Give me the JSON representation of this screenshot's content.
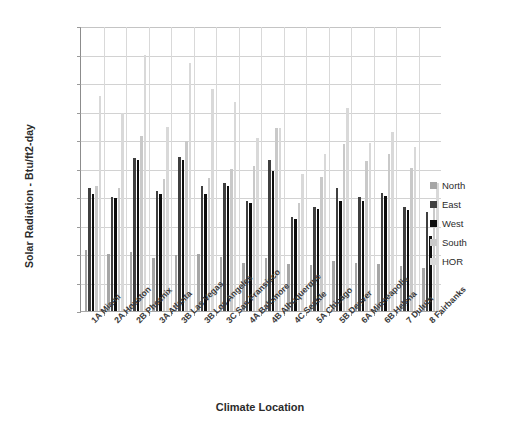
{
  "chart_data": {
    "type": "bar",
    "title": "",
    "xlabel": "Climate Location",
    "ylabel": "Solar Radiation - Btu/ft2-day",
    "ylim": [
      0,
      2000
    ],
    "ytick_step": 200,
    "ytick_labels": [
      "0",
      "200",
      "400",
      "600",
      "800",
      "1,000",
      "1,200",
      "1,400",
      "1,600",
      "1,800",
      "2,000"
    ],
    "grid": true,
    "legend_position": "right",
    "categories": [
      "1A Miami",
      "2A Houston",
      "2B Phoenix",
      "3A Atlanta",
      "3B Las Vegas",
      "3B Los Angeles",
      "3C San Fransisco",
      "4A Baltimore",
      "4B Albuquerque",
      "4C Seattle",
      "5A Chicago",
      "5B Denver",
      "6A Minneapolis",
      "6B Helena",
      "7 Duluth",
      "8 Fairbanks"
    ],
    "series": [
      {
        "name": "North",
        "color": "#a6a6a6",
        "values": [
          425,
          400,
          415,
          370,
          395,
          400,
          380,
          340,
          370,
          330,
          320,
          350,
          340,
          330,
          315,
          300
        ]
      },
      {
        "name": "East",
        "color": "#3f3f3f",
        "values": [
          860,
          800,
          1075,
          840,
          1080,
          880,
          900,
          770,
          1060,
          660,
          730,
          860,
          800,
          825,
          730,
          695
        ]
      },
      {
        "name": "West",
        "color": "#0d0d0d",
        "values": [
          820,
          790,
          1060,
          820,
          1060,
          820,
          880,
          755,
          985,
          645,
          715,
          770,
          775,
          805,
          710,
          525
        ]
      },
      {
        "name": "South",
        "color": "#c9c9c9",
        "values": [
          880,
          860,
          1225,
          925,
          1190,
          930,
          1000,
          1020,
          1285,
          760,
          940,
          1170,
          1055,
          1100,
          1005,
          775
        ]
      },
      {
        "name": "HOR",
        "color": "#d9d9d9",
        "values": [
          1510,
          1390,
          1800,
          1290,
          1740,
          1555,
          1470,
          1215,
          1285,
          960,
          1105,
          1425,
          1180,
          1255,
          1150,
          900
        ]
      }
    ]
  },
  "legend": {
    "items": [
      {
        "label": "North",
        "color": "#a6a6a6"
      },
      {
        "label": "East",
        "color": "#3f3f3f"
      },
      {
        "label": "West",
        "color": "#0d0d0d"
      },
      {
        "label": "South",
        "color": "#c9c9c9"
      },
      {
        "label": "HOR",
        "color": "#d9d9d9"
      }
    ]
  },
  "axes": {
    "y_title": "Solar Radiation - Btu/ft2-day",
    "x_title": "Climate Location"
  }
}
